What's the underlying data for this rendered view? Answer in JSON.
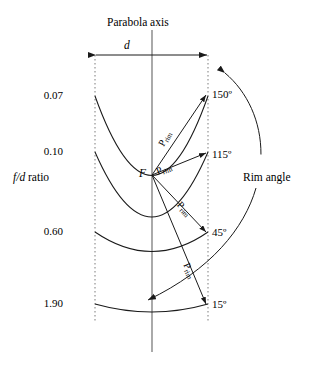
{
  "figure": {
    "title": "Parabola axis",
    "width_label": "d",
    "left_axis_label_prefix": "f/d",
    "left_axis_label_suffix": " ratio",
    "right_axis_label": "Rim angle",
    "focus_label": "F"
  },
  "fd_ratios": [
    {
      "value": "0.07",
      "x": 63,
      "y": 96
    },
    {
      "value": "0.10",
      "x": 63,
      "y": 152
    },
    {
      "value": "0.60",
      "x": 63,
      "y": 232
    },
    {
      "value": "1.90",
      "x": 63,
      "y": 304
    }
  ],
  "rim_angles": [
    {
      "value": "150º",
      "x": 212,
      "y": 95
    },
    {
      "value": "115º",
      "x": 212,
      "y": 155
    },
    {
      "value": "45º",
      "x": 212,
      "y": 233
    },
    {
      "value": "15º",
      "x": 212,
      "y": 305
    }
  ],
  "prim_labels": [
    {
      "letter": "P",
      "sub": "rim",
      "x": 162,
      "y": 140,
      "rot": -62
    },
    {
      "letter": "P",
      "sub": "rim",
      "x": 157,
      "y": 167,
      "rot": -22
    },
    {
      "letter": "P",
      "sub": "rim",
      "x": 178,
      "y": 198,
      "rot": 47
    },
    {
      "letter": "P",
      "sub": "rim",
      "x": 185,
      "y": 258,
      "rot": 65
    }
  ],
  "chart_data": {
    "type": "line",
    "title": "Parabola axis",
    "xlabel": "d",
    "ylabel": "f/d ratio",
    "series_label_left": "f/d ratio",
    "series_label_right": "Rim angle",
    "categories": [
      "0.07",
      "0.10",
      "0.60",
      "1.90"
    ],
    "fd_ratio_values": [
      0.07,
      0.1,
      0.6,
      1.9
    ],
    "rim_angle_values": [
      150,
      115,
      45,
      15
    ],
    "pairs": [
      {
        "fd_ratio": 0.07,
        "rim_angle_deg": 150
      },
      {
        "fd_ratio": 0.1,
        "rim_angle_deg": 115
      },
      {
        "fd_ratio": 0.6,
        "rim_angle_deg": 45
      },
      {
        "fd_ratio": 1.9,
        "rim_angle_deg": 15
      }
    ],
    "annotations": [
      "F",
      "P_rim",
      "d",
      "Parabola axis",
      "Rim angle"
    ],
    "grid": false,
    "legend": "none"
  }
}
